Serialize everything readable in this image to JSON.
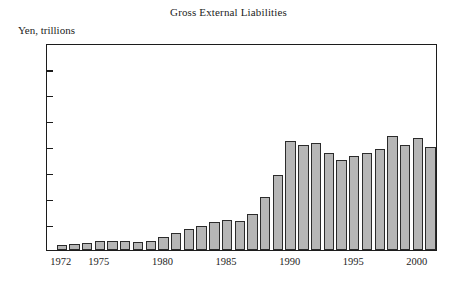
{
  "chart_data": {
    "type": "bar",
    "title": "Gross External Liabilities",
    "ylabel": "Yen, trillions",
    "xlabel": "",
    "ylim": [
      0,
      400
    ],
    "yticks": [
      50,
      100,
      150,
      200,
      250,
      300,
      350
    ],
    "xticks": [
      "1972",
      "1975",
      "1980",
      "1985",
      "1990",
      "1995",
      "2000"
    ],
    "grid": false,
    "legend": null,
    "bar_color": "#b6b6b6",
    "bar_edge_color": "#2b2b2b",
    "categories": [
      "1972",
      "1973",
      "1974",
      "1975",
      "1976",
      "1977",
      "1978",
      "1979",
      "1980",
      "1981",
      "1982",
      "1983",
      "1984",
      "1985",
      "1986",
      "1987",
      "1988",
      "1989",
      "1990",
      "1991",
      "1992",
      "1993",
      "1994",
      "1995",
      "1996",
      "1997",
      "1998",
      "1999",
      "2000",
      "2001"
    ],
    "values": [
      9,
      11,
      13,
      17,
      17,
      18,
      15,
      17,
      26,
      33,
      40,
      47,
      55,
      58,
      57,
      70,
      103,
      145,
      210,
      203,
      206,
      188,
      173,
      181,
      187,
      196,
      220,
      203,
      217,
      199
    ]
  },
  "axis": {
    "y_min_label": "50",
    "y_max_label": "350"
  }
}
